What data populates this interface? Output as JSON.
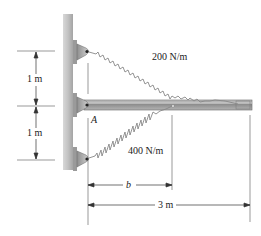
{
  "figure": {
    "type": "statics-problem-diagram",
    "labels": {
      "spring_top": "200 N/m",
      "spring_bottom": "400 N/m",
      "point_a": "A",
      "dim_upper": "1 m",
      "dim_lower": "1 m",
      "dim_b": "b",
      "dim_length": "3 m"
    },
    "elements": {
      "wall": "vertical wall with three pin brackets",
      "beam": "horizontal beam pinned at A",
      "spring_1": "spring k = 200 N/m from top bracket to beam end",
      "spring_2": "spring k = 400 N/m from bottom bracket to beam at distance b"
    },
    "colors": {
      "wall": "#b8b8b8",
      "beam": "#9a9a9a",
      "bracket": "#a8a8a8",
      "line": "#333333"
    }
  }
}
